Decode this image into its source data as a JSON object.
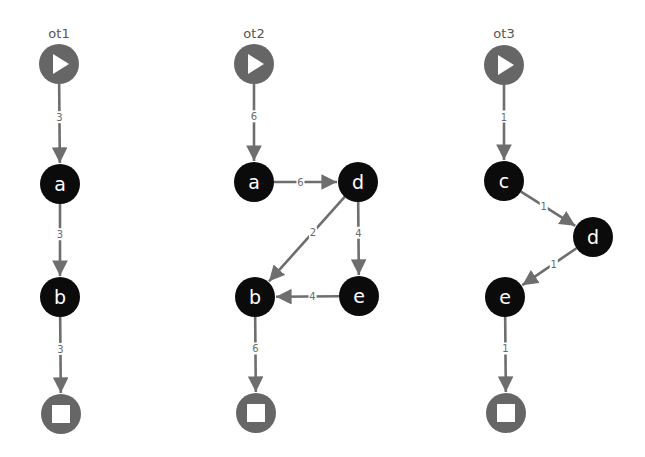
{
  "colors": {
    "task_node": "#0b0b0b",
    "terminal_node": "#666666",
    "edge": "#6e6e6e",
    "edge_label": "#6a6a6a",
    "background": "#ffffff"
  },
  "node_radius": 20,
  "graphs": [
    {
      "id": "ot1",
      "title": "ot1",
      "title_pos": [
        59,
        38
      ],
      "nodes": [
        {
          "id": "start",
          "type": "start",
          "x": 59,
          "y": 64
        },
        {
          "id": "a",
          "type": "task",
          "label": "a",
          "x": 60,
          "y": 184
        },
        {
          "id": "b",
          "type": "task",
          "label": "b",
          "x": 60,
          "y": 297
        },
        {
          "id": "end",
          "type": "end",
          "x": 61,
          "y": 414
        }
      ],
      "edges": [
        {
          "from": "start",
          "to": "a",
          "label": "3"
        },
        {
          "from": "a",
          "to": "b",
          "label": "3"
        },
        {
          "from": "b",
          "to": "end",
          "label": "3"
        }
      ]
    },
    {
      "id": "ot2",
      "title": "ot2",
      "title_pos": [
        254,
        38
      ],
      "nodes": [
        {
          "id": "start",
          "type": "start",
          "x": 254,
          "y": 64
        },
        {
          "id": "a",
          "type": "task",
          "label": "a",
          "x": 254,
          "y": 182
        },
        {
          "id": "d",
          "type": "task",
          "label": "d",
          "x": 358,
          "y": 182
        },
        {
          "id": "e",
          "type": "task",
          "label": "e",
          "x": 359,
          "y": 296
        },
        {
          "id": "b",
          "type": "task",
          "label": "b",
          "x": 255,
          "y": 297
        },
        {
          "id": "end",
          "type": "end",
          "x": 256,
          "y": 413
        }
      ],
      "edges": [
        {
          "from": "start",
          "to": "a",
          "label": "6"
        },
        {
          "from": "a",
          "to": "d",
          "label": "6"
        },
        {
          "from": "d",
          "to": "b",
          "label": "2"
        },
        {
          "from": "d",
          "to": "e",
          "label": "4"
        },
        {
          "from": "e",
          "to": "b",
          "label": "4"
        },
        {
          "from": "b",
          "to": "end",
          "label": "6"
        }
      ]
    },
    {
      "id": "ot3",
      "title": "ot3",
      "title_pos": [
        504,
        38
      ],
      "nodes": [
        {
          "id": "start",
          "type": "start",
          "x": 504,
          "y": 65
        },
        {
          "id": "c",
          "type": "task",
          "label": "c",
          "x": 504,
          "y": 181
        },
        {
          "id": "d",
          "type": "task",
          "label": "d",
          "x": 593,
          "y": 237
        },
        {
          "id": "e",
          "type": "task",
          "label": "e",
          "x": 505,
          "y": 297
        },
        {
          "id": "end",
          "type": "end",
          "x": 506,
          "y": 413
        }
      ],
      "edges": [
        {
          "from": "start",
          "to": "c",
          "label": "1"
        },
        {
          "from": "c",
          "to": "d",
          "label": "1"
        },
        {
          "from": "d",
          "to": "e",
          "label": "1"
        },
        {
          "from": "e",
          "to": "end",
          "label": "1"
        }
      ]
    }
  ]
}
